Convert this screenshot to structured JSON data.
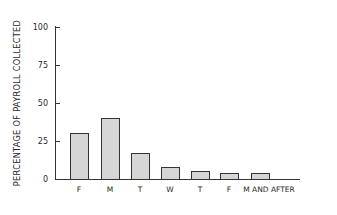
{
  "chart_data": {
    "type": "bar",
    "title": "",
    "xlabel": "",
    "ylabel": "PERCENTAGE OF PAYROLL COLLECTED",
    "categories": [
      "F",
      "M",
      "T",
      "W",
      "T",
      "F",
      "M AND AFTER"
    ],
    "values": [
      30,
      40,
      17,
      8,
      5,
      4,
      4
    ],
    "ylim": [
      0,
      100
    ],
    "yticks": [
      0,
      25,
      50,
      75,
      100
    ],
    "grid": false,
    "legend": null
  },
  "colors": {
    "bar_fill": "#d6d6d6",
    "bar_edge": "#333333",
    "axis": "#333333"
  }
}
